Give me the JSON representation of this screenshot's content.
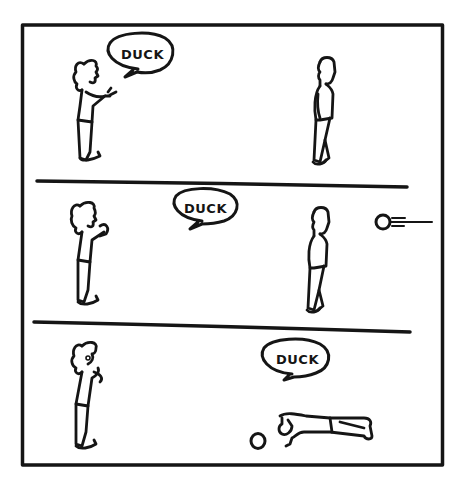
{
  "comic": {
    "panel_count": 3,
    "colors": {
      "ink": "#151515",
      "paper": "#ffffff"
    },
    "panels": [
      {
        "index": 1,
        "speech_bubble": {
          "text": "DUCK",
          "speaker": "left-person"
        },
        "characters": [
          "left-person-standing",
          "right-person-standing"
        ],
        "objects": []
      },
      {
        "index": 2,
        "speech_bubble": {
          "text": "DUCK",
          "speaker": "left-person"
        },
        "characters": [
          "left-person-standing",
          "right-person-standing"
        ],
        "objects": [
          "flying-ball"
        ]
      },
      {
        "index": 3,
        "speech_bubble": {
          "text": "DUCK",
          "speaker": "lying-person"
        },
        "characters": [
          "left-person-standing",
          "right-person-lying-down"
        ],
        "objects": [
          "ball-on-ground"
        ]
      }
    ]
  }
}
